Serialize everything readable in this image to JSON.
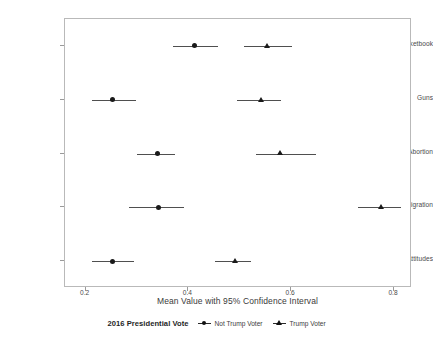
{
  "chart_data": {
    "type": "scatter",
    "title": "",
    "xlabel": "Mean Value with 95% Confidence Interval",
    "ylabel": "Predictor",
    "xlim": [
      0.16,
      0.835
    ],
    "xticks": [
      0.2,
      0.4,
      0.6,
      0.8
    ],
    "xtick_labels": [
      "0.2",
      "0.4",
      "0.6",
      "0.8"
    ],
    "categories": [
      "Pocketbook",
      "Guns",
      "Abortion",
      "Immigration",
      "Racial Attitudes"
    ],
    "grid": false,
    "legend_position": "bottom",
    "legend_title": "2016 Presidential Vote",
    "series": [
      {
        "name": "Not Trump Voter",
        "marker": "circle",
        "points": [
          {
            "category": "Pocketbook",
            "value": 0.412,
            "ci_low": 0.37,
            "ci_high": 0.457
          },
          {
            "category": "Guns",
            "value": 0.252,
            "ci_low": 0.212,
            "ci_high": 0.298
          },
          {
            "category": "Abortion",
            "value": 0.339,
            "ci_low": 0.301,
            "ci_high": 0.374
          },
          {
            "category": "Immigration",
            "value": 0.341,
            "ci_low": 0.284,
            "ci_high": 0.392
          },
          {
            "category": "Racial Attitudes",
            "value": 0.253,
            "ci_low": 0.213,
            "ci_high": 0.295
          }
        ]
      },
      {
        "name": "Trump Voter",
        "marker": "triangle",
        "points": [
          {
            "category": "Pocketbook",
            "value": 0.553,
            "ci_low": 0.508,
            "ci_high": 0.601
          },
          {
            "category": "Guns",
            "value": 0.542,
            "ci_low": 0.495,
            "ci_high": 0.581
          },
          {
            "category": "Abortion",
            "value": 0.578,
            "ci_low": 0.532,
            "ci_high": 0.648
          },
          {
            "category": "Immigration",
            "value": 0.775,
            "ci_low": 0.729,
            "ci_high": 0.814
          },
          {
            "category": "Racial Attitudes",
            "value": 0.492,
            "ci_low": 0.452,
            "ci_high": 0.521
          }
        ]
      }
    ]
  },
  "axes": {
    "y_title": "Predictor",
    "x_title": "Mean Value with 95% Confidence Interval",
    "y_tick_labels": [
      "Pocketbook",
      "Guns",
      "Abortion",
      "Immigration",
      "Racial Attitudes"
    ],
    "x_tick_labels": [
      "0.2",
      "0.4",
      "0.6",
      "0.8"
    ]
  },
  "legend": {
    "title": "2016 Presidential Vote",
    "items": [
      {
        "label": "Not Trump Voter",
        "marker": "circle"
      },
      {
        "label": "Trump Voter",
        "marker": "triangle"
      }
    ]
  },
  "colors": {
    "marker": "#1a1a1a",
    "ci_line": "#4f4f4f",
    "panel_border": "#b9b9b9",
    "text": "#3a3a3a",
    "background": "#ffffff"
  }
}
